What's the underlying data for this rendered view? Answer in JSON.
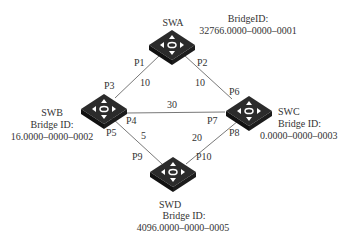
{
  "switches": {
    "swa": {
      "name": "SWA",
      "bridge_label": "BridgeID:",
      "bridge_id": "32766.0000–0000–0001"
    },
    "swb": {
      "name": "SWB",
      "bridge_label": "Bridge ID:",
      "bridge_id": "16.0000–0000–0002"
    },
    "swc": {
      "name": "SWC",
      "bridge_label": "Bridge ID:",
      "bridge_id": "0.0000–0000–0003"
    },
    "swd": {
      "name": "SWD",
      "bridge_label": "Bridge ID:",
      "bridge_id": "4096.0000–0000–0005"
    }
  },
  "ports": {
    "p1": "P1",
    "p2": "P2",
    "p3": "P3",
    "p4": "P4",
    "p5": "P5",
    "p6": "P6",
    "p7": "P7",
    "p8": "P8",
    "p9": "P9",
    "p10": "P10"
  },
  "links": {
    "a_b_cost": "10",
    "a_c_cost": "10",
    "b_c_cost": "30",
    "b_d_cost": "5",
    "c_d_cost": "20"
  },
  "colors": {
    "line": "#555555",
    "switch_top": "#2b2b2b",
    "switch_side": "#111111"
  }
}
